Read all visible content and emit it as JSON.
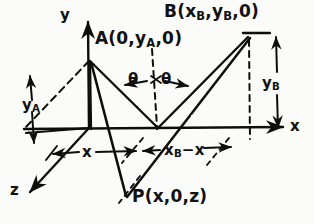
{
  "diagram": {
    "style": "hand-drawn pen on paper",
    "ink_color": "#111111",
    "paper_color": "#fbfbfa"
  },
  "axes": [
    {
      "name": "y-axis",
      "label": "y",
      "direction": "up",
      "label_pos": [
        63,
        14
      ]
    },
    {
      "name": "x-axis",
      "label": "x",
      "direction": "right",
      "label_pos": [
        292,
        119
      ]
    },
    {
      "name": "z-axis",
      "label": "z",
      "direction": "down-left",
      "label_pos": [
        12,
        188
      ]
    }
  ],
  "points": [
    {
      "name": "point-A",
      "label_parts": {
        "letter": "A",
        "open": "(0,",
        "sub_base": "y",
        "sub_script": "A",
        "close": ",0)"
      },
      "label_text": "A(0,yA,0)",
      "label_pos": [
        96,
        32
      ],
      "vertex": [
        90,
        60
      ]
    },
    {
      "name": "point-B",
      "label_parts": {
        "letter": "B",
        "open": "(x",
        "sub1": "B",
        "mid": ",y",
        "sub2": "B",
        "close": ",0)"
      },
      "label_text": "B(xB,yB,0)",
      "label_pos": [
        165,
        4
      ],
      "vertex": [
        249,
        36
      ]
    },
    {
      "name": "point-P",
      "label_parts": {
        "letter": "P",
        "open": "(x,0,z)"
      },
      "label_text": "P(x,0,z)",
      "label_pos": [
        133,
        189
      ],
      "vertex": [
        126,
        196
      ]
    }
  ],
  "angles": [
    {
      "name": "angle-theta-left",
      "label": "θ",
      "pos": [
        131,
        78
      ]
    },
    {
      "name": "angle-theta-right",
      "label": "θ",
      "pos": [
        163,
        78
      ]
    }
  ],
  "dimensions": [
    {
      "name": "dimension-y-A",
      "base": "y",
      "script": "A",
      "text": "yA",
      "pos": [
        26,
        104
      ],
      "orientation": "vertical",
      "arrows": "double"
    },
    {
      "name": "dimension-y-B",
      "base": "y",
      "script": "B",
      "text": "yB",
      "pos": [
        266,
        80
      ],
      "orientation": "vertical",
      "arrows": "double"
    },
    {
      "name": "dimension-x",
      "text": "x",
      "pos": [
        86,
        152
      ],
      "orientation": "horizontal",
      "arrows": "double"
    },
    {
      "name": "dimension-xB-minus-x",
      "base": "x",
      "script": "B",
      "rest": "−x",
      "text": "xB-x",
      "pos": [
        170,
        150
      ],
      "orientation": "horizontal",
      "arrows": "double"
    }
  ],
  "segments": [
    {
      "name": "segment-A-to-P",
      "from": "A",
      "to": "P",
      "style": "solid"
    },
    {
      "name": "segment-B-to-P",
      "from": "B",
      "to": "P",
      "style": "solid"
    },
    {
      "name": "segment-A-to-foot",
      "from": "A",
      "to": "foot-of-normal",
      "style": "solid"
    },
    {
      "name": "segment-B-to-foot",
      "from": "B",
      "to": "foot-of-normal",
      "style": "solid"
    },
    {
      "name": "segment-A-drop",
      "from": "A",
      "to": "origin",
      "style": "solid"
    },
    {
      "name": "segment-B-drop",
      "from": "B",
      "to": "x-axis",
      "style": "dashed"
    },
    {
      "name": "normal-line-at-foot",
      "from": "foot-of-normal",
      "to": "above-foot",
      "style": "dashed"
    },
    {
      "name": "back-plane-edge",
      "from": "A",
      "to": "z-axis-corner",
      "style": "dashed"
    },
    {
      "name": "z-parallel-at-x",
      "style": "dashed"
    },
    {
      "name": "z-parallel-at-xB",
      "style": "dashed"
    }
  ]
}
